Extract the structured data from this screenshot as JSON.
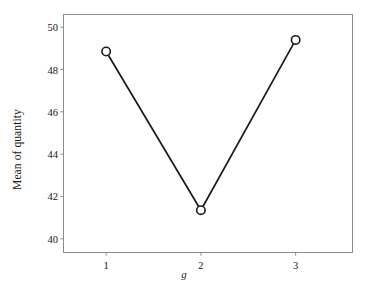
{
  "chart_data": {
    "type": "line",
    "title": "",
    "xlabel": "g",
    "ylabel": "Mean of quantity",
    "categories": [
      "1",
      "2",
      "3"
    ],
    "x": [
      1,
      2,
      3
    ],
    "values": [
      48.85,
      41.35,
      49.4
    ],
    "series": [
      {
        "name": "Mean of quantity",
        "values": [
          48.85,
          41.35,
          49.4
        ]
      }
    ],
    "xlim": [
      0.55,
      3.6
    ],
    "ylim": [
      39.35,
      50.6
    ],
    "xticks": [
      "1",
      "2",
      "3"
    ],
    "yticks": [
      "40",
      "42",
      "44",
      "46",
      "48",
      "50"
    ],
    "ytick_values": [
      40,
      42,
      44,
      46,
      48,
      50
    ],
    "grid": false,
    "legend": false,
    "legend_position": "none",
    "marker": "open-circle",
    "line_color": "#1a1a1a",
    "marker_edge_color": "#1a1a1a",
    "marker_face_color": "#ffffff",
    "frame_color": "#8c8c8c",
    "background_color": "#ffffff"
  },
  "figure": {
    "ylabel": "Mean of quantity",
    "xlabel": "g"
  }
}
